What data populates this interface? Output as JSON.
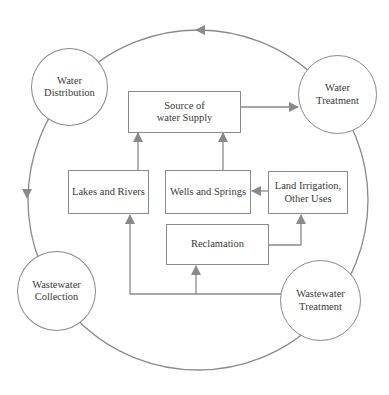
{
  "diagram": {
    "type": "water cycle flow diagram",
    "colors": {
      "stroke": "#8a8a8a",
      "text": "#3a3a3a",
      "background": "#ffffff"
    },
    "circles": [
      {
        "id": "water-distribution",
        "label": "Water\nDistribution"
      },
      {
        "id": "water-treatment",
        "label": "Water\nTreatment"
      },
      {
        "id": "wastewater-collection",
        "label": "Wastewater\nCollection"
      },
      {
        "id": "wastewater-treatment",
        "label": "Wastewater\nTreatment"
      }
    ],
    "boxes": [
      {
        "id": "source-of-water-supply",
        "label": "Source of\nwater Supply"
      },
      {
        "id": "lakes-and-rivers",
        "label": "Lakes and Rivers"
      },
      {
        "id": "wells-and-springs",
        "label": "Wells and Springs"
      },
      {
        "id": "land-irrigation",
        "label": "Land Irrigation,\nOther Uses"
      },
      {
        "id": "reclamation",
        "label": "Reclamation"
      }
    ],
    "edges": [
      {
        "from": "Water Treatment",
        "to": "Water Distribution",
        "style": "outer arc, counter-clockwise"
      },
      {
        "from": "Water Distribution",
        "to": "Wastewater Collection",
        "style": "outer arc"
      },
      {
        "from": "Wastewater Collection",
        "to": "Wastewater Treatment",
        "style": "outer arc"
      },
      {
        "from": "Wastewater Treatment",
        "to": "Water Treatment",
        "style": "outer arc"
      },
      {
        "from": "Source of water Supply",
        "to": "Water Treatment"
      },
      {
        "from": "Lakes and Rivers",
        "to": "Source of water Supply"
      },
      {
        "from": "Wells and Springs",
        "to": "Source of water Supply"
      },
      {
        "from": "Land Irrigation, Other Uses",
        "to": "Wells and Springs"
      },
      {
        "from": "Reclamation",
        "to": "Land Irrigation, Other Uses"
      },
      {
        "from": "Wastewater Treatment",
        "to": "Reclamation"
      },
      {
        "from": "Wastewater Treatment",
        "to": "Lakes and Rivers"
      }
    ]
  }
}
